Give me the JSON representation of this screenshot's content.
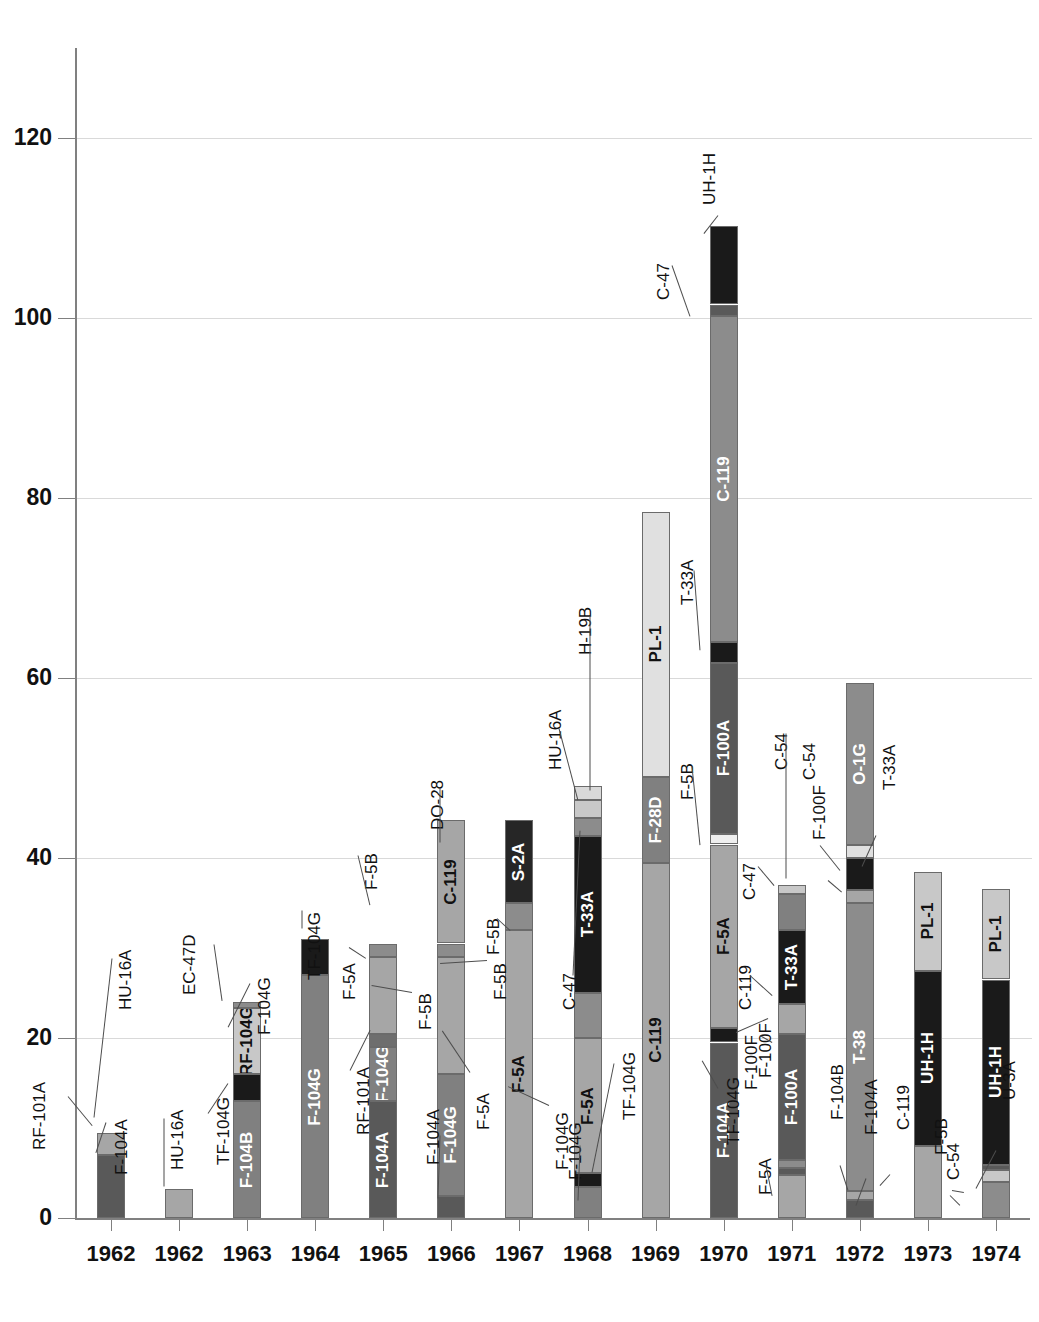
{
  "chart_data": {
    "type": "bar",
    "subtype": "stacked",
    "title": "",
    "xlabel": "",
    "ylabel": "",
    "ylim": [
      0,
      130
    ],
    "yticks": [
      0,
      20,
      40,
      60,
      80,
      100,
      120
    ],
    "grid": true,
    "legend": "none",
    "categories": [
      "1962",
      "1962",
      "1963",
      "1964",
      "1965",
      "1966",
      "1967",
      "1968",
      "1969",
      "1970",
      "1971",
      "1972",
      "1973",
      "1974"
    ],
    "bars": [
      {
        "category": "1962",
        "total": 9.5,
        "segments": [
          {
            "name": "F-104A",
            "value": 7.0,
            "color": "#595959",
            "label_inside": false
          },
          {
            "name": "RF-101A",
            "value": 2.5,
            "color": "#a6a6a6",
            "label_inside": false
          }
        ]
      },
      {
        "category": "1962",
        "total": 3.2,
        "segments": [
          {
            "name": "HU-16A",
            "value": 3.2,
            "color": "#a6a6a6",
            "label_inside": false
          }
        ]
      },
      {
        "category": "1963",
        "total": 24.0,
        "segments": [
          {
            "name": "F-104B",
            "value": 13.0,
            "color": "#808080",
            "label_inside": true
          },
          {
            "name": "TF-104G",
            "value": 3.0,
            "color": "#1a1a1a",
            "label_inside": false
          },
          {
            "name": "RF-104G",
            "value": 7.3,
            "color": "#c8c8c8",
            "label_inside": true
          },
          {
            "name": "F-104G",
            "value": 0.7,
            "color": "#8c8c8c",
            "label_inside": false
          },
          {
            "name": "EC-47D",
            "value": 0.0,
            "color": "#8c8c8c",
            "label_inside": false
          }
        ]
      },
      {
        "category": "1964",
        "total": 31.0,
        "segments": [
          {
            "name": "F-104G",
            "value": 27.0,
            "color": "#808080",
            "label_inside": true
          },
          {
            "name": "TF-104G",
            "value": 4.0,
            "color": "#1a1a1a",
            "label_inside": false
          }
        ]
      },
      {
        "category": "1965",
        "total": 30.5,
        "segments": [
          {
            "name": "F-104A",
            "value": 13.0,
            "color": "#595959",
            "label_inside": true
          },
          {
            "name": "F-104G",
            "value": 6.0,
            "color": "#808080",
            "label_inside": true
          },
          {
            "name": "RF-101A",
            "value": 1.5,
            "color": "#6e6e6e",
            "label_inside": false
          },
          {
            "name": "F-5A",
            "value": 8.5,
            "color": "#a6a6a6",
            "label_inside": false
          },
          {
            "name": "F-5B",
            "value": 1.5,
            "color": "#8c8c8c",
            "label_inside": false
          }
        ]
      },
      {
        "category": "1966",
        "total": 44.2,
        "segments": [
          {
            "name": "F-104A",
            "value": 2.5,
            "color": "#595959",
            "label_inside": false
          },
          {
            "name": "F-104G",
            "value": 13.5,
            "color": "#808080",
            "label_inside": true
          },
          {
            "name": "F-5A",
            "value": 13.0,
            "color": "#a6a6a6",
            "label_inside": false
          },
          {
            "name": "F-5B",
            "value": 1.5,
            "color": "#8c8c8c",
            "label_inside": false
          },
          {
            "name": "C-119",
            "value": 13.7,
            "color": "#a6a6a6",
            "label_inside": true
          },
          {
            "name": "DO-28",
            "value": 0.0,
            "color": "#a6a6a6",
            "label_inside": false
          }
        ]
      },
      {
        "category": "1967",
        "total": 44.2,
        "segments": [
          {
            "name": "F-5A",
            "value": 32.0,
            "color": "#a6a6a6",
            "label_inside": true
          },
          {
            "name": "F-5B",
            "value": 3.0,
            "color": "#8c8c8c",
            "label_inside": false
          },
          {
            "name": "S-2A",
            "value": 9.2,
            "color": "#262626",
            "label_inside": true
          }
        ]
      },
      {
        "category": "1968",
        "total": 48.0,
        "segments": [
          {
            "name": "F-104G",
            "value": 3.5,
            "color": "#808080",
            "label_inside": false
          },
          {
            "name": "TF-104G",
            "value": 1.5,
            "color": "#1a1a1a",
            "label_inside": false
          },
          {
            "name": "F-5A",
            "value": 15.0,
            "color": "#a6a6a6",
            "label_inside": true
          },
          {
            "name": "F-5B",
            "value": 5.0,
            "color": "#8c8c8c",
            "label_inside": true
          },
          {
            "name": "T-33A",
            "value": 17.5,
            "color": "#1a1a1a",
            "label_inside": true
          },
          {
            "name": "C-47",
            "value": 2.0,
            "color": "#8c8c8c",
            "label_inside": false
          },
          {
            "name": "HU-16A",
            "value": 2.0,
            "color": "#c8c8c8",
            "label_inside": false
          },
          {
            "name": "H-19B",
            "value": 1.5,
            "color": "#d9d9d9",
            "label_inside": false
          }
        ]
      },
      {
        "category": "1969",
        "total": 78.5,
        "segments": [
          {
            "name": "C-119",
            "value": 39.5,
            "color": "#a6a6a6",
            "label_inside": true
          },
          {
            "name": "F-28D",
            "value": 9.5,
            "color": "#808080",
            "label_inside": true
          },
          {
            "name": "PL-1",
            "value": 29.5,
            "color": "#e0e0e0",
            "label_inside": true
          }
        ]
      },
      {
        "category": "1970",
        "total": 110.2,
        "segments": [
          {
            "name": "F-104A",
            "value": 19.5,
            "color": "#595959",
            "label_inside": true
          },
          {
            "name": "TF-104G",
            "value": 1.6,
            "color": "#1a1a1a",
            "label_inside": false
          },
          {
            "name": "F-5A",
            "value": 20.4,
            "color": "#a6a6a6",
            "label_inside": true
          },
          {
            "name": "F-5B",
            "value": 1.2,
            "color": "#efefef",
            "label_inside": false
          },
          {
            "name": "F-100A",
            "value": 19.0,
            "color": "#595959",
            "label_inside": true
          },
          {
            "name": "T-33A",
            "value": 2.3,
            "color": "#1a1a1a",
            "label_inside": false
          },
          {
            "name": "C-119",
            "value": 36.2,
            "color": "#8c8c8c",
            "label_inside": true
          },
          {
            "name": "C-47",
            "value": 1.3,
            "color": "#595959",
            "label_inside": false
          },
          {
            "name": "UH-1H",
            "value": 8.7,
            "color": "#1a1a1a",
            "label_inside": false
          }
        ]
      },
      {
        "category": "1971",
        "total": 37.0,
        "segments": [
          {
            "name": "F-5A",
            "value": 4.8,
            "color": "#a6a6a6",
            "label_inside": false
          },
          {
            "name": "TF-104G",
            "value": 0.8,
            "color": "#595959",
            "label_inside": false
          },
          {
            "name": "F-100F",
            "value": 0.8,
            "color": "#8c8c8c",
            "label_inside": false
          },
          {
            "name": "F-100A",
            "value": 14.0,
            "color": "#595959",
            "label_inside": true
          },
          {
            "name": "C-119",
            "value": 3.4,
            "color": "#a6a6a6",
            "label_inside": false
          },
          {
            "name": "T-33A",
            "value": 8.2,
            "color": "#1a1a1a",
            "label_inside": true
          },
          {
            "name": "C-54",
            "value": 4.0,
            "color": "#808080",
            "label_inside": false
          },
          {
            "name": "C-47",
            "value": 1.0,
            "color": "#c8c8c8",
            "label_inside": false
          }
        ]
      },
      {
        "category": "1972",
        "total": 59.5,
        "segments": [
          {
            "name": "F-104A",
            "value": 2.0,
            "color": "#595959",
            "label_inside": false
          },
          {
            "name": "F-104B",
            "value": 1.0,
            "color": "#a6a6a6",
            "label_inside": false
          },
          {
            "name": "T-38",
            "value": 32.0,
            "color": "#8c8c8c",
            "label_inside": true
          },
          {
            "name": "F-100F",
            "value": 1.5,
            "color": "#a6a6a6",
            "label_inside": false
          },
          {
            "name": "T-33A",
            "value": 3.5,
            "color": "#1a1a1a",
            "label_inside": false
          },
          {
            "name": "C-54",
            "value": 1.5,
            "color": "#e0e0e0",
            "label_inside": false
          },
          {
            "name": "O-1G",
            "value": 18.0,
            "color": "#8c8c8c",
            "label_inside": true
          }
        ]
      },
      {
        "category": "1973",
        "total": 38.5,
        "segments": [
          {
            "name": "C-119",
            "value": 8.0,
            "color": "#a6a6a6",
            "label_inside": false
          },
          {
            "name": "UH-1H",
            "value": 19.5,
            "color": "#1a1a1a",
            "label_inside": true
          },
          {
            "name": "PL-1",
            "value": 11.0,
            "color": "#c8c8c8",
            "label_inside": true
          }
        ]
      },
      {
        "category": "1974",
        "total": 36.6,
        "segments": [
          {
            "name": "F-5B",
            "value": 4.0,
            "color": "#8c8c8c",
            "label_inside": false
          },
          {
            "name": "C-54",
            "value": 1.3,
            "color": "#c8c8c8",
            "label_inside": false
          },
          {
            "name": "U-3A",
            "value": 0.6,
            "color": "#595959",
            "label_inside": false
          },
          {
            "name": "UH-1H",
            "value": 20.6,
            "color": "#1a1a1a",
            "label_inside": true
          },
          {
            "name": "PL-1",
            "value": 10.1,
            "color": "#c8c8c8",
            "label_inside": true
          }
        ]
      }
    ],
    "callouts": [
      {
        "text": "RF-101A",
        "bar": 0
      },
      {
        "text": "F-104A",
        "bar": 0
      },
      {
        "text": "HU-16A",
        "bar": 0
      },
      {
        "text": "HU-16A",
        "bar": 1
      },
      {
        "text": "EC-47D",
        "bar": 2
      },
      {
        "text": "F-104G",
        "bar": 2
      },
      {
        "text": "TF-104G",
        "bar": 2
      },
      {
        "text": "TF-104G",
        "bar": 3
      },
      {
        "text": "F-5B",
        "bar": 4
      },
      {
        "text": "F-5A",
        "bar": 4
      },
      {
        "text": "RF-101A",
        "bar": 4
      },
      {
        "text": "F-5B",
        "bar": 4
      },
      {
        "text": "DO-28",
        "bar": 5
      },
      {
        "text": "F-5B",
        "bar": 5
      },
      {
        "text": "F-5A",
        "bar": 5
      },
      {
        "text": "F-104A",
        "bar": 5
      },
      {
        "text": "F-5B",
        "bar": 6
      },
      {
        "text": "F-104G",
        "bar": 6
      },
      {
        "text": "H-19B",
        "bar": 7
      },
      {
        "text": "HU-16A",
        "bar": 7
      },
      {
        "text": "C-47",
        "bar": 7
      },
      {
        "text": "TF-104G",
        "bar": 7
      },
      {
        "text": "F-104G",
        "bar": 7
      },
      {
        "text": "C-47",
        "bar": 9
      },
      {
        "text": "UH-1H",
        "bar": 9
      },
      {
        "text": "T-33A",
        "bar": 9
      },
      {
        "text": "F-5B",
        "bar": 9
      },
      {
        "text": "TF-104G",
        "bar": 9
      },
      {
        "text": "F-100F",
        "bar": 9
      },
      {
        "text": "C-54",
        "bar": 10
      },
      {
        "text": "C-47",
        "bar": 10
      },
      {
        "text": "C-119",
        "bar": 10
      },
      {
        "text": "F-100F",
        "bar": 10
      },
      {
        "text": "F-5A",
        "bar": 10
      },
      {
        "text": "C-54",
        "bar": 11
      },
      {
        "text": "T-33A",
        "bar": 11
      },
      {
        "text": "F-100F",
        "bar": 11
      },
      {
        "text": "F-104B",
        "bar": 11
      },
      {
        "text": "F-104A",
        "bar": 11
      },
      {
        "text": "C-119",
        "bar": 12
      },
      {
        "text": "U-3A",
        "bar": 13
      },
      {
        "text": "C-54",
        "bar": 13
      },
      {
        "text": "F-5B",
        "bar": 13
      }
    ]
  },
  "axis": {
    "y_tick_labels": [
      "0",
      "20",
      "40",
      "60",
      "80",
      "100",
      "120"
    ],
    "x_tick_labels": [
      "1962",
      "1962",
      "1963",
      "1964",
      "1965",
      "1966",
      "1967",
      "1968",
      "1969",
      "1970",
      "1971",
      "1972",
      "1973",
      "1974"
    ]
  },
  "colors": {
    "grid": "#d9d9d9",
    "axis": "#808080",
    "text": "#111111",
    "background": "#ffffff"
  }
}
